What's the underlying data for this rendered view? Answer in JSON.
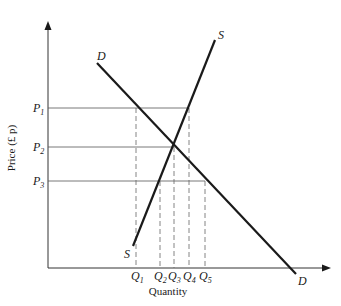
{
  "diagram": {
    "type": "supply-demand",
    "axes": {
      "y_label": "Price (£ p)",
      "x_label": "Quantity"
    },
    "curves": {
      "demand": {
        "label": "D",
        "label_end": "D",
        "color": "#1a1a1a"
      },
      "supply": {
        "label": "S",
        "label_end": "S",
        "color": "#1a1a1a"
      }
    },
    "price_levels": [
      {
        "label": "P",
        "sub": "1"
      },
      {
        "label": "P",
        "sub": "2"
      },
      {
        "label": "P",
        "sub": "3"
      }
    ],
    "quantity_levels": [
      {
        "label": "Q",
        "sub": "1"
      },
      {
        "label": "Q",
        "sub": "2"
      },
      {
        "label": "Q",
        "sub": "3"
      },
      {
        "label": "Q",
        "sub": "4"
      },
      {
        "label": "Q",
        "sub": "5"
      }
    ],
    "colors": {
      "line": "#1a1a1a",
      "guide": "#555555",
      "background": "#ffffff"
    }
  }
}
